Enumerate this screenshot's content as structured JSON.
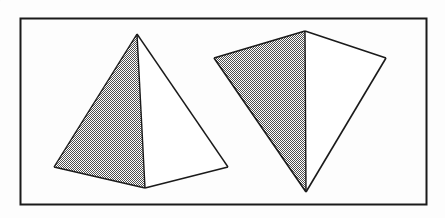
{
  "figure": {
    "canvas": {
      "width": 445,
      "height": 218
    },
    "colors": {
      "background": "#fdfdfd",
      "stroke": "#1a1a1a",
      "shade_dark": "#4a4a4a",
      "shade_light": "#ffffff",
      "face_light": "#ffffff"
    },
    "border": {
      "label": "figure-frame",
      "x": 20.5,
      "y": 18.5,
      "width": 406,
      "height": 186,
      "stroke_width": 2
    },
    "shapes": [
      {
        "name": "pyramid-left",
        "label": "Upright pyramid",
        "apex": [
          137,
          34
        ],
        "vertices": {
          "apex": [
            137,
            34
          ],
          "base_left": [
            54,
            167
          ],
          "base_front": [
            145,
            188
          ],
          "base_right": [
            228,
            167
          ]
        },
        "faces": [
          {
            "name": "left-face-shaded",
            "fill": "dither",
            "points": "137,34 54,167 145,188"
          },
          {
            "name": "right-face-light",
            "fill": "white",
            "points": "137,34 145,188 228,167"
          }
        ],
        "edges": [
          "137,34 54,167",
          "137,34 228,167",
          "137,34 145,188",
          "54,167 145,188",
          "145,188 228,167"
        ]
      },
      {
        "name": "pyramid-right",
        "label": "Tilted pyramid",
        "apex": [
          306,
          192
        ],
        "vertices": {
          "top": [
            305,
            31
          ],
          "left": [
            214,
            58
          ],
          "bottom": [
            306,
            192
          ],
          "right": [
            386,
            58
          ]
        },
        "faces": [
          {
            "name": "left-face-shaded",
            "fill": "dither",
            "points": "305,31 214,58 306,192"
          },
          {
            "name": "right-face-light",
            "fill": "white",
            "points": "305,31 386,58 306,192"
          }
        ],
        "edges": [
          "305,31 214,58",
          "305,31 386,58",
          "305,31 306,192",
          "214,58 306,192",
          "386,58 306,192"
        ]
      }
    ]
  }
}
